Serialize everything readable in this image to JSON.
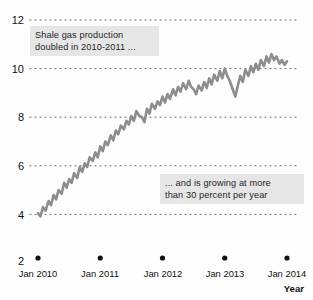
{
  "chart_data": {
    "type": "line",
    "title": "",
    "xlabel": "Year",
    "ylabel": "",
    "xlim": [
      "Jan 2010",
      "Jan 2014"
    ],
    "ylim": [
      2,
      12
    ],
    "yticks": [
      12,
      10,
      8,
      6,
      4,
      2
    ],
    "xticks": [
      "Jan 2010",
      "Jan 2011",
      "Jan 2012",
      "Jan 2013",
      "Jan 2014"
    ],
    "grid": "horizontal-dotted",
    "legend": "none",
    "series": [
      {
        "name": "Shale gas production",
        "color": "#8d8d8d",
        "x": [
          0.0,
          0.04,
          0.08,
          0.12,
          0.17,
          0.21,
          0.25,
          0.29,
          0.33,
          0.38,
          0.42,
          0.46,
          0.5,
          0.54,
          0.58,
          0.63,
          0.67,
          0.71,
          0.75,
          0.79,
          0.83,
          0.88,
          0.92,
          0.96,
          1.0,
          1.04,
          1.08,
          1.12,
          1.17,
          1.21,
          1.25,
          1.29,
          1.33,
          1.38,
          1.42,
          1.46,
          1.5,
          1.54,
          1.58,
          1.63,
          1.67,
          1.71,
          1.75,
          1.79,
          1.83,
          1.88,
          1.92,
          1.96,
          2.0,
          2.04,
          2.08,
          2.12,
          2.17,
          2.21,
          2.25,
          2.29,
          2.33,
          2.38,
          2.42,
          2.46,
          2.5,
          2.54,
          2.58,
          2.63,
          2.67,
          2.71,
          2.75,
          2.79,
          2.83,
          2.88,
          2.92,
          2.96,
          3.0,
          3.04,
          3.08,
          3.12,
          3.17,
          3.21,
          3.25,
          3.29,
          3.33,
          3.38,
          3.42,
          3.46,
          3.5,
          3.54,
          3.58,
          3.63,
          3.67,
          3.71,
          3.75,
          3.79,
          3.83,
          3.88,
          3.92,
          3.96,
          4.0
        ],
        "y": [
          4.05,
          3.92,
          4.3,
          4.15,
          4.55,
          4.38,
          4.8,
          4.62,
          5.0,
          4.85,
          5.3,
          5.1,
          5.45,
          5.3,
          5.7,
          5.5,
          5.95,
          5.75,
          6.1,
          5.95,
          6.35,
          6.2,
          6.55,
          6.35,
          6.8,
          6.6,
          7.0,
          6.85,
          7.25,
          7.05,
          7.45,
          7.3,
          7.65,
          7.5,
          7.85,
          7.7,
          8.05,
          7.85,
          8.25,
          8.05,
          8.0,
          7.8,
          8.35,
          8.15,
          8.55,
          8.35,
          8.65,
          8.5,
          8.85,
          8.6,
          8.95,
          8.75,
          9.15,
          8.9,
          9.25,
          9.05,
          9.4,
          9.15,
          9.5,
          9.25,
          9.15,
          8.95,
          9.3,
          9.1,
          9.45,
          9.2,
          9.6,
          9.35,
          9.75,
          9.5,
          9.9,
          9.6,
          10.0,
          9.7,
          9.5,
          9.2,
          8.85,
          9.3,
          9.7,
          9.45,
          9.95,
          9.7,
          10.1,
          9.85,
          10.2,
          9.95,
          10.35,
          10.1,
          10.5,
          10.25,
          10.6,
          10.35,
          10.5,
          10.2,
          10.35,
          10.15,
          10.3
        ]
      }
    ],
    "annotations": [
      {
        "id": "annotation-top",
        "text": "Shale gas production\ndoubled in 2010-2011 ..."
      },
      {
        "id": "annotation-bottom",
        "text": "... and is growing at more\nthan 30 percent per year"
      }
    ]
  }
}
